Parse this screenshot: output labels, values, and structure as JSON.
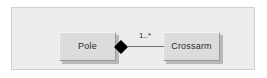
{
  "diagram": {
    "type": "uml-class-diagram",
    "relationship": "composition",
    "frame": {
      "background_color": "#ececec",
      "border_color": "#cfcfcf"
    },
    "classes": [
      {
        "id": "pole",
        "name": "Pole",
        "role": "whole"
      },
      {
        "id": "crossarm",
        "name": "Crossarm",
        "role": "part"
      }
    ],
    "association": {
      "source": "Pole",
      "target": "Crossarm",
      "source_adornment": "filled-diamond",
      "target_multiplicity": "1..*",
      "line_color": "#6f6f6f"
    },
    "icons": {
      "composition_diamond": "filled-diamond-icon"
    },
    "colors": {
      "box_fill": "#dcdcdc",
      "box_shadow": "#b9b9b9",
      "box_highlight": "#f4f4f4",
      "box_lowlight": "#9a9a9a",
      "text": "#2b2b2b",
      "diamond_fill": "#000000"
    }
  }
}
